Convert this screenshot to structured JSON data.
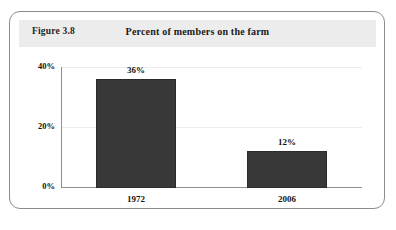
{
  "figure": {
    "number": "Figure 3.8",
    "title": "Percent of members on the farm"
  },
  "chart_data": {
    "type": "bar",
    "title": "Percent of members on the farm",
    "xlabel": "",
    "ylabel": "",
    "categories": [
      "1972",
      "2006"
    ],
    "values": [
      36,
      12
    ],
    "value_labels": [
      "36%",
      "12%"
    ],
    "ylim": [
      0,
      40
    ],
    "yticks": [
      0,
      20,
      40
    ],
    "ytick_labels": [
      "0%",
      "20%",
      "40%"
    ],
    "grid": true,
    "legend": "none",
    "bar_color": "#383838",
    "units": "percent"
  }
}
